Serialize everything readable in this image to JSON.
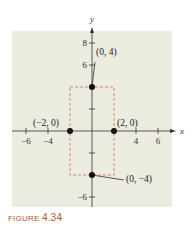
{
  "chart_data": {
    "type": "scatter",
    "title": "",
    "xlabel": "x",
    "ylabel": "y",
    "xlim": [
      -7,
      7
    ],
    "ylim": [
      -7,
      9
    ],
    "x_ticks": [
      -6,
      -4,
      4,
      6
    ],
    "x_tick_marks": [
      -6,
      -4,
      -2,
      2,
      4,
      6
    ],
    "y_ticks": [
      8,
      6,
      -6
    ],
    "y_tick_marks": [
      8,
      6,
      4,
      2,
      -2,
      -4,
      -6
    ],
    "grid": false,
    "points": [
      {
        "x": 0,
        "y": 4,
        "label": "(0, 4)"
      },
      {
        "x": -2,
        "y": 0,
        "label": "(−2, 0)"
      },
      {
        "x": 2,
        "y": 0,
        "label": "(2, 0)"
      },
      {
        "x": 0,
        "y": -4,
        "label": "(0, −4)"
      }
    ],
    "dashed_rectangle": {
      "x_min": -2,
      "x_max": 2,
      "y_min": -4,
      "y_max": 4
    },
    "background": "#ebebdf",
    "rect_color": "#d9826a"
  },
  "caption": {
    "prefix": "FIGURE",
    "number": "4.34"
  }
}
